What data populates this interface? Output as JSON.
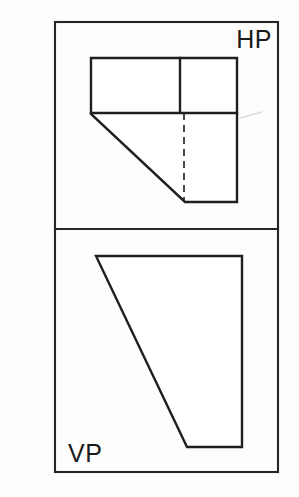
{
  "sheet": {
    "background_color": "#fdfdfc",
    "line_color": "#1f1f1f",
    "width": 299,
    "height": 497
  },
  "drawing": {
    "title": "Orthographic projection",
    "description": "Two-view engineering drawing showing top view on the horizontal plane and front view on the vertical plane of a chamfered L-shaped block",
    "projection_line_label": "XY",
    "border": {
      "x": 55,
      "y": 22,
      "width": 223,
      "height": 450,
      "stroke_width": 2.1
    },
    "divider": {
      "y": 229,
      "x_start": 55,
      "x_end": 278
    }
  },
  "views": [
    {
      "id": "hp-view",
      "label": "HP",
      "label_meaning": "Horizontal Plane (top view)",
      "label_x": 272,
      "label_y": 48,
      "label_anchor": "end",
      "outline_points": "91,58 237,58 237,202 185,202 91,114",
      "internal_lines": [
        {
          "name": "vertical-partition",
          "x1": 180,
          "y1": 58,
          "x2": 180,
          "y2": 112
        },
        {
          "name": "horizontal-partition",
          "x1": 91,
          "y1": 113,
          "x2": 237,
          "y2": 113
        }
      ],
      "hidden_lines": [
        {
          "name": "hidden-vertical-edge",
          "x1": 184,
          "y1": 113,
          "x2": 184,
          "y2": 201
        }
      ],
      "chamfer": {
        "x1": 91,
        "y1": 114,
        "x2": 185,
        "y2": 202
      }
    },
    {
      "id": "vp-view",
      "label": "VP",
      "label_meaning": "Vertical Plane (front view)",
      "label_x": 68,
      "label_y": 462,
      "label_anchor": "start",
      "outline_points": "96,256 242,256 242,447 187,447",
      "internal_lines": [],
      "hidden_lines": [],
      "chamfer": {
        "x1": 96,
        "y1": 256,
        "x2": 187,
        "y2": 447
      }
    }
  ],
  "artifacts": [
    {
      "name": "scan-smudge",
      "path": "M 240,118 L 262,112"
    }
  ]
}
